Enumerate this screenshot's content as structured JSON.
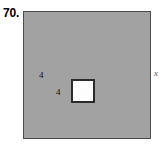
{
  "figure": {
    "problem_number": "70.",
    "outer_square": {
      "fill_color": "#a2a2a2",
      "border_color": "#4c4c4c",
      "side_label": "x"
    },
    "inner_square": {
      "fill_color": "#fdfdfd",
      "border_color": "#2b2b2b",
      "left_side_label": "4",
      "bottom_side_label": "4"
    }
  }
}
